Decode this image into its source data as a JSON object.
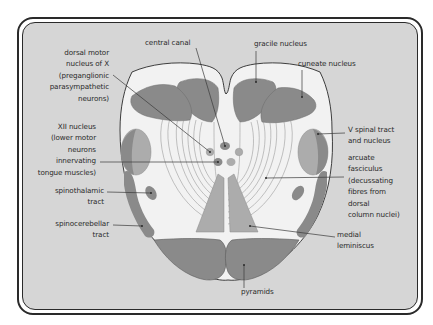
{
  "diagram": {
    "colors": {
      "frame_background": "#d6d6d6",
      "section_fill": "#f2f2f2",
      "dark_structure": "#8a8a8a",
      "light_structure": "#acacac",
      "outline": "#2a2a2a",
      "leader_line": "#3a3a3a"
    },
    "labels": {
      "central_canal": "central canal",
      "gracile_nucleus": "gracile nucleus",
      "cuneate_nucleus": "cuneate nucleus",
      "dorsal_motor_nucleus": [
        "dorsal motor",
        "nucleus of X",
        "(preganglionic",
        "parasympathetic",
        "neurons)"
      ],
      "xii_nucleus": [
        "XII nucleus",
        "(lower motor",
        "neurons",
        "innervating",
        "tongue muscles)"
      ],
      "spinothalamic_tract": [
        "spinothalamic",
        "tract"
      ],
      "spinocerebellar_tract": [
        "spinocerebellar",
        "tract"
      ],
      "v_spinal_tract": [
        "V spinal tract",
        "and nucleus"
      ],
      "arcuate_fasciculus": [
        "arcuate",
        "fasciculus",
        "(decussating",
        "fibres from",
        "dorsal",
        "column nuclei)"
      ],
      "medial_lemniscus": [
        "medial",
        "leminiscus"
      ],
      "pyramids": "pyramids"
    }
  }
}
